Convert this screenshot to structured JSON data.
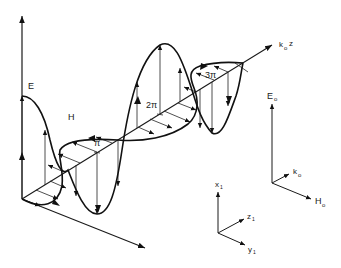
{
  "figure": {
    "wave_labels": {
      "e_field": "E",
      "h_field": "H",
      "propagation_axis": "k",
      "propagation_axis_sub": "o",
      "propagation_axis_suffix": "z",
      "phase_marks": [
        "π",
        "2π",
        "3π"
      ]
    },
    "field_triad": {
      "e": "E",
      "e_sub": "o",
      "k": "k",
      "k_sub": "o",
      "h": "H",
      "h_sub": "o"
    },
    "coordinate_triad": {
      "x": "x",
      "x_sub": "1",
      "y": "y",
      "y_sub": "1",
      "z": "z",
      "z_sub": "1"
    }
  },
  "colors": {
    "line": "#1a1a1a",
    "background": "#ffffff"
  }
}
